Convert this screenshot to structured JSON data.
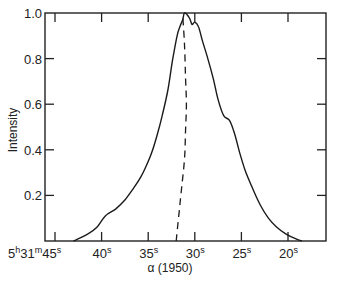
{
  "chart_data": {
    "type": "line",
    "title": "",
    "xlabel": "α (1950)",
    "ylabel": "Intensity",
    "x_unit": "seconds of right ascension (5h31m + s)",
    "x_ticks": [
      {
        "value": 45,
        "label": "5h31m45s"
      },
      {
        "value": 40,
        "label": "40s"
      },
      {
        "value": 35,
        "label": "35s"
      },
      {
        "value": 30,
        "label": "30s"
      },
      {
        "value": 25,
        "label": "25s"
      },
      {
        "value": 20,
        "label": "20s"
      }
    ],
    "y_ticks": [
      {
        "value": 0.2,
        "label": "0.2"
      },
      {
        "value": 0.4,
        "label": "0.4"
      },
      {
        "value": 0.6,
        "label": "0.6"
      },
      {
        "value": 0.8,
        "label": "0.8"
      },
      {
        "value": 1.0,
        "label": "1.0"
      }
    ],
    "xlim": [
      46.1,
      15.9
    ],
    "ylim": [
      0,
      1.0
    ],
    "grid": false,
    "legend": null,
    "series": [
      {
        "name": "intensity profile",
        "style": "solid",
        "x": [
          43.0,
          41.5,
          40.5,
          39.6,
          38.5,
          37.5,
          36.6,
          35.8,
          35.2,
          34.6,
          34.0,
          33.5,
          32.9,
          32.4,
          31.9,
          31.6,
          31.3,
          31.1,
          30.6,
          30.3,
          30.0,
          29.6,
          29.2,
          28.6,
          28.0,
          27.5,
          26.9,
          26.3,
          25.8,
          25.2,
          24.6,
          23.9,
          23.0,
          22.1,
          21.2,
          20.2,
          19.2,
          18.5
        ],
        "y": [
          0.0,
          0.03,
          0.06,
          0.11,
          0.14,
          0.18,
          0.23,
          0.28,
          0.33,
          0.39,
          0.47,
          0.55,
          0.66,
          0.79,
          0.9,
          0.94,
          0.97,
          1.0,
          0.98,
          0.95,
          0.96,
          0.94,
          0.88,
          0.8,
          0.71,
          0.62,
          0.55,
          0.53,
          0.48,
          0.39,
          0.31,
          0.24,
          0.16,
          0.1,
          0.06,
          0.03,
          0.01,
          0.0
        ]
      },
      {
        "name": "center line",
        "style": "dashed",
        "x": [
          32.0,
          31.7,
          31.4,
          31.1,
          31.0,
          30.9,
          31.0,
          31.1,
          31.3
        ],
        "y": [
          0.0,
          0.12,
          0.24,
          0.36,
          0.48,
          0.6,
          0.72,
          0.86,
          0.99
        ]
      }
    ]
  },
  "axes": {
    "xlabel": "α (1950)",
    "ylabel": "Intensity",
    "first_x_label": {
      "h": "5",
      "h_sup": "h",
      "m": "31",
      "m_sup": "m",
      "s": "45",
      "s_sup": "s"
    }
  }
}
